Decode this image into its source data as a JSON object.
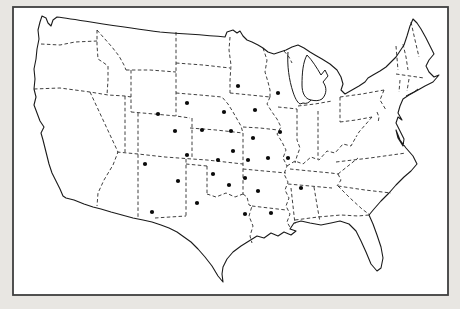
{
  "figure": {
    "kind": "dot-distribution-map",
    "region": "continental United States",
    "marker": "filled-circle",
    "dot_count": 28
  },
  "colors": {
    "page_background": "#e8e6e2",
    "map_background": "#ffffff",
    "frame": "#3f3f3f",
    "outline_ink": "#1a1a1a",
    "state_border_ink": "#2a2a2a",
    "dot": "#0a0a0a"
  },
  "map": {
    "dot_radius": 2.1,
    "frame": {
      "x": 13,
      "y": 7,
      "width": 435,
      "height": 288
    }
  },
  "chart_data": {
    "type": "scatter",
    "title": "",
    "points": [
      [
        238,
        86
      ],
      [
        278,
        93
      ],
      [
        187,
        103
      ],
      [
        224,
        112
      ],
      [
        255,
        110
      ],
      [
        158,
        114
      ],
      [
        175,
        131
      ],
      [
        202,
        130
      ],
      [
        231,
        131
      ],
      [
        280,
        132
      ],
      [
        253,
        138
      ],
      [
        233,
        151
      ],
      [
        187,
        155
      ],
      [
        268,
        158
      ],
      [
        288,
        158
      ],
      [
        218,
        160
      ],
      [
        248,
        160
      ],
      [
        145,
        164
      ],
      [
        213,
        174
      ],
      [
        245,
        178
      ],
      [
        178,
        181
      ],
      [
        229,
        185
      ],
      [
        258,
        191
      ],
      [
        301,
        188
      ],
      [
        197,
        203
      ],
      [
        152,
        212
      ],
      [
        245,
        214
      ],
      [
        271,
        213
      ]
    ]
  }
}
